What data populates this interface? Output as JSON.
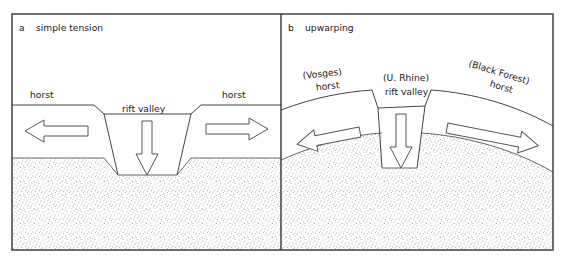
{
  "figure": {
    "frame_color": "#333333",
    "line_color": "#444444",
    "stipple_color": "#b8b8b8",
    "background_color": "#ffffff"
  },
  "panels": [
    {
      "id": "a",
      "label": "a",
      "title": "simple tension",
      "block_labels": [
        {
          "name": "horst-left",
          "lines": [
            "horst"
          ]
        },
        {
          "name": "rift-valley",
          "lines": [
            "rift valley"
          ]
        },
        {
          "name": "horst-right",
          "lines": [
            "horst"
          ]
        }
      ],
      "arrows": [
        {
          "name": "tension-arrow-left",
          "direction": "left",
          "style": "hollow-outline"
        },
        {
          "name": "subsidence-arrow",
          "direction": "down",
          "style": "hollow-outline"
        },
        {
          "name": "tension-arrow-right",
          "direction": "right",
          "style": "hollow-outline"
        }
      ]
    },
    {
      "id": "b",
      "label": "b",
      "title": "upwarping",
      "block_labels": [
        {
          "name": "vosges-horst",
          "lines": [
            "(Vosges)",
            "horst"
          ]
        },
        {
          "name": "upper-rhine-valley",
          "lines": [
            "(U. Rhine)",
            "rift valley"
          ]
        },
        {
          "name": "black-forest-horst",
          "lines": [
            "(Black Forest)",
            "horst"
          ]
        }
      ],
      "arrows": [
        {
          "name": "tension-arrow-left",
          "direction": "left",
          "style": "hollow-outline"
        },
        {
          "name": "subsidence-arrow",
          "direction": "down",
          "style": "hollow-outline"
        },
        {
          "name": "tension-arrow-right",
          "direction": "right",
          "style": "hollow-outline"
        }
      ]
    }
  ],
  "legend": {
    "stipple_meaning": "basement / deeper crust",
    "white_meaning": "upper crustal blocks"
  }
}
